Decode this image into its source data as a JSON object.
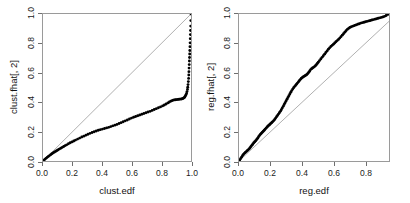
{
  "figure": {
    "background": "#ffffff",
    "box_color": "#9a9a9a",
    "point_color": "#000000",
    "refline_color": "#8c8c8c"
  },
  "chart_data": [
    {
      "type": "scatter",
      "panel": "left",
      "title": "",
      "xlabel": "clust.edf",
      "ylabel": "clust.fhat[, 2]",
      "xlim": [
        0.0,
        1.0
      ],
      "ylim": [
        0.0,
        1.0
      ],
      "xticks": [
        "0.0",
        "0.2",
        "0.4",
        "0.6",
        "0.8",
        "1.0"
      ],
      "xtickvals": [
        0.0,
        0.2,
        0.4,
        0.6,
        0.8,
        1.0
      ],
      "yticks": [
        "0.0",
        "0.2",
        "0.4",
        "0.6",
        "0.8",
        "1.0"
      ],
      "ytickvals": [
        0.0,
        0.2,
        0.4,
        0.6,
        0.8,
        1.0
      ],
      "grid": false,
      "legend": "none",
      "reference_line": {
        "from": [
          0.0,
          0.0
        ],
        "to": [
          1.0,
          1.0
        ],
        "label": "y = x"
      },
      "x": [
        0.004,
        0.012,
        0.02,
        0.028,
        0.036,
        0.044,
        0.052,
        0.06,
        0.068,
        0.076,
        0.084,
        0.092,
        0.1,
        0.11,
        0.12,
        0.13,
        0.14,
        0.15,
        0.16,
        0.172,
        0.184,
        0.196,
        0.208,
        0.22,
        0.234,
        0.248,
        0.262,
        0.276,
        0.29,
        0.304,
        0.318,
        0.332,
        0.346,
        0.36,
        0.374,
        0.388,
        0.402,
        0.416,
        0.43,
        0.444,
        0.458,
        0.472,
        0.486,
        0.5,
        0.514,
        0.528,
        0.542,
        0.556,
        0.57,
        0.584,
        0.598,
        0.612,
        0.626,
        0.64,
        0.654,
        0.668,
        0.682,
        0.696,
        0.71,
        0.724,
        0.738,
        0.752,
        0.766,
        0.78,
        0.794,
        0.808,
        0.82,
        0.832,
        0.844,
        0.854,
        0.864,
        0.872,
        0.88,
        0.888,
        0.896,
        0.904,
        0.912,
        0.92,
        0.928,
        0.936,
        0.942,
        0.948,
        0.954,
        0.958,
        0.962,
        0.966,
        0.97,
        0.973,
        0.976,
        0.978,
        0.98,
        0.982,
        0.984,
        0.985,
        0.986,
        0.987,
        0.988,
        0.989,
        0.99,
        0.991,
        0.992,
        0.993,
        0.994,
        0.995,
        0.996,
        0.997,
        0.998,
        0.999,
        1.0
      ],
      "y": [
        0.004,
        0.011,
        0.018,
        0.025,
        0.031,
        0.037,
        0.043,
        0.049,
        0.055,
        0.06,
        0.065,
        0.07,
        0.075,
        0.081,
        0.087,
        0.093,
        0.099,
        0.105,
        0.11,
        0.117,
        0.124,
        0.13,
        0.136,
        0.142,
        0.149,
        0.156,
        0.163,
        0.169,
        0.176,
        0.182,
        0.188,
        0.194,
        0.199,
        0.204,
        0.209,
        0.213,
        0.217,
        0.221,
        0.225,
        0.229,
        0.234,
        0.239,
        0.244,
        0.249,
        0.255,
        0.261,
        0.267,
        0.273,
        0.279,
        0.286,
        0.292,
        0.298,
        0.303,
        0.308,
        0.313,
        0.318,
        0.323,
        0.328,
        0.333,
        0.338,
        0.344,
        0.35,
        0.356,
        0.362,
        0.368,
        0.375,
        0.381,
        0.388,
        0.395,
        0.401,
        0.407,
        0.411,
        0.414,
        0.416,
        0.417,
        0.418,
        0.419,
        0.42,
        0.421,
        0.422,
        0.424,
        0.427,
        0.431,
        0.436,
        0.442,
        0.45,
        0.46,
        0.472,
        0.487,
        0.502,
        0.52,
        0.54,
        0.562,
        0.585,
        0.608,
        0.632,
        0.656,
        0.68,
        0.704,
        0.728,
        0.752,
        0.778,
        0.804,
        0.832,
        0.86,
        0.888,
        0.918,
        0.955,
        1.0
      ]
    },
    {
      "type": "scatter",
      "panel": "right",
      "title": "",
      "xlabel": "reg.edf",
      "ylabel": "reg.fhat[, 2]",
      "xlim": [
        0.0,
        0.95
      ],
      "ylim": [
        0.0,
        1.0
      ],
      "xticks": [
        "0.0",
        "0.2",
        "0.4",
        "0.6",
        "0.8"
      ],
      "xtickvals": [
        0.0,
        0.2,
        0.4,
        0.6,
        0.8
      ],
      "yticks": [
        "0.0",
        "0.2",
        "0.4",
        "0.6",
        "0.8",
        "1.0"
      ],
      "ytickvals": [
        0.0,
        0.2,
        0.4,
        0.6,
        0.8,
        1.0
      ],
      "grid": false,
      "legend": "none",
      "reference_line": {
        "from": [
          0.0,
          0.0
        ],
        "to": [
          0.95,
          0.95
        ],
        "label": "y = x"
      },
      "x": [
        0.004,
        0.01,
        0.016,
        0.022,
        0.028,
        0.034,
        0.04,
        0.046,
        0.052,
        0.058,
        0.064,
        0.07,
        0.076,
        0.082,
        0.088,
        0.094,
        0.1,
        0.106,
        0.112,
        0.118,
        0.124,
        0.13,
        0.136,
        0.142,
        0.148,
        0.154,
        0.16,
        0.166,
        0.172,
        0.178,
        0.184,
        0.19,
        0.196,
        0.202,
        0.208,
        0.214,
        0.22,
        0.226,
        0.232,
        0.238,
        0.244,
        0.25,
        0.256,
        0.262,
        0.268,
        0.274,
        0.28,
        0.286,
        0.292,
        0.298,
        0.304,
        0.31,
        0.316,
        0.322,
        0.328,
        0.334,
        0.34,
        0.346,
        0.352,
        0.358,
        0.364,
        0.37,
        0.376,
        0.382,
        0.388,
        0.394,
        0.4,
        0.406,
        0.412,
        0.418,
        0.424,
        0.43,
        0.436,
        0.442,
        0.448,
        0.454,
        0.46,
        0.466,
        0.472,
        0.478,
        0.484,
        0.49,
        0.496,
        0.502,
        0.51,
        0.518,
        0.526,
        0.534,
        0.542,
        0.55,
        0.558,
        0.566,
        0.574,
        0.582,
        0.59,
        0.598,
        0.606,
        0.614,
        0.622,
        0.63,
        0.638,
        0.646,
        0.654,
        0.662,
        0.67,
        0.678,
        0.686,
        0.694,
        0.702,
        0.712,
        0.722,
        0.732,
        0.742,
        0.752,
        0.762,
        0.772,
        0.782,
        0.792,
        0.802,
        0.812,
        0.822,
        0.832,
        0.842,
        0.852,
        0.862,
        0.872,
        0.882,
        0.892,
        0.902,
        0.912,
        0.922,
        0.932,
        0.942
      ],
      "y": [
        0.006,
        0.016,
        0.026,
        0.036,
        0.044,
        0.052,
        0.058,
        0.064,
        0.07,
        0.076,
        0.082,
        0.09,
        0.099,
        0.108,
        0.116,
        0.124,
        0.131,
        0.138,
        0.146,
        0.155,
        0.165,
        0.174,
        0.182,
        0.189,
        0.196,
        0.203,
        0.21,
        0.217,
        0.224,
        0.231,
        0.238,
        0.244,
        0.25,
        0.256,
        0.262,
        0.268,
        0.275,
        0.283,
        0.292,
        0.301,
        0.31,
        0.319,
        0.328,
        0.338,
        0.349,
        0.36,
        0.372,
        0.384,
        0.396,
        0.408,
        0.42,
        0.432,
        0.444,
        0.456,
        0.468,
        0.479,
        0.489,
        0.498,
        0.506,
        0.514,
        0.522,
        0.53,
        0.538,
        0.546,
        0.554,
        0.561,
        0.567,
        0.572,
        0.576,
        0.58,
        0.584,
        0.589,
        0.596,
        0.604,
        0.613,
        0.622,
        0.628,
        0.633,
        0.637,
        0.642,
        0.648,
        0.655,
        0.663,
        0.672,
        0.683,
        0.694,
        0.705,
        0.716,
        0.727,
        0.738,
        0.749,
        0.76,
        0.77,
        0.779,
        0.787,
        0.795,
        0.803,
        0.811,
        0.819,
        0.827,
        0.836,
        0.846,
        0.856,
        0.866,
        0.876,
        0.886,
        0.895,
        0.902,
        0.908,
        0.913,
        0.918,
        0.922,
        0.926,
        0.93,
        0.934,
        0.938,
        0.941,
        0.944,
        0.947,
        0.95,
        0.953,
        0.956,
        0.959,
        0.962,
        0.965,
        0.968,
        0.971,
        0.974,
        0.977,
        0.98,
        0.984,
        0.99,
        0.997
      ]
    }
  ]
}
